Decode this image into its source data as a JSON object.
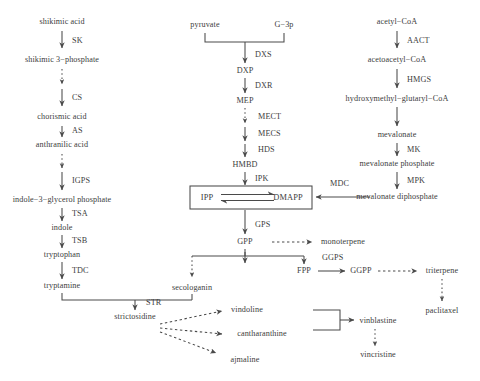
{
  "diagram": {
    "background_color": "#ffffff",
    "text_color": "#3d3d3d",
    "line_color": "#4a4a4a"
  },
  "shikimate_pathway": {
    "name": "shikimate / indole branch",
    "metabolites": [
      {
        "id": "shikimic_acid",
        "label": "shikimic acid",
        "x": 62,
        "y": 22
      },
      {
        "id": "shikimic_3_phosphate",
        "label": "shikimic 3−phosphate",
        "x": 62,
        "y": 60
      },
      {
        "id": "chorismic_acid",
        "label": "chorismic acid",
        "x": 62,
        "y": 117
      },
      {
        "id": "anthranilic_acid",
        "label": "anthranilic acid",
        "x": 62,
        "y": 145
      },
      {
        "id": "indole_3_glycerol_phosphate",
        "label": "indole−3−glycerol phosphate",
        "x": 62,
        "y": 200
      },
      {
        "id": "indole",
        "label": "indole",
        "x": 62,
        "y": 228
      },
      {
        "id": "tryptophan",
        "label": "tryptophan",
        "x": 62,
        "y": 255
      },
      {
        "id": "tryptamine",
        "label": "tryptamine",
        "x": 62,
        "y": 286
      }
    ],
    "enzymes": [
      {
        "id": "SK",
        "label": "SK",
        "x": 72,
        "y": 41,
        "style": "solid"
      },
      {
        "id": "CS",
        "label": "CS",
        "x": 72,
        "y": 98,
        "style": "solid"
      },
      {
        "id": "AS",
        "label": "AS",
        "x": 72,
        "y": 131,
        "style": "solid"
      },
      {
        "id": "IGPS",
        "label": "IGPS",
        "x": 72,
        "y": 181,
        "style": "solid"
      },
      {
        "id": "TSA",
        "label": "TSA",
        "x": 72,
        "y": 214,
        "style": "solid"
      },
      {
        "id": "TSB",
        "label": "TSB",
        "x": 72,
        "y": 241,
        "style": "solid"
      },
      {
        "id": "TDC",
        "label": "TDC",
        "x": 72,
        "y": 271,
        "style": "solid"
      }
    ]
  },
  "mep_pathway": {
    "name": "MEP / non−mevalonate branch",
    "metabolites": [
      {
        "id": "pyruvate",
        "label": "pyruvate",
        "x": 205,
        "y": 25
      },
      {
        "id": "g3p",
        "label": "G−3p",
        "x": 284,
        "y": 25
      },
      {
        "id": "DXP",
        "label": "DXP",
        "x": 245,
        "y": 71
      },
      {
        "id": "MEP",
        "label": "MEP",
        "x": 245,
        "y": 101
      },
      {
        "id": "HMBD",
        "label": "HMBD",
        "x": 245,
        "y": 165
      },
      {
        "id": "GPP",
        "label": "GPP",
        "x": 245,
        "y": 242
      }
    ],
    "enzymes": [
      {
        "id": "DXS",
        "label": "DXS",
        "x": 255,
        "y": 55,
        "style": "solid"
      },
      {
        "id": "DXR",
        "label": "DXR",
        "x": 255,
        "y": 86,
        "style": "solid"
      },
      {
        "id": "MECT",
        "label": "MECT",
        "x": 258,
        "y": 117,
        "style": "dashed"
      },
      {
        "id": "MECS",
        "label": "MECS",
        "x": 258,
        "y": 134,
        "style": "solid"
      },
      {
        "id": "HDS",
        "label": "HDS",
        "x": 258,
        "y": 150,
        "style": "solid"
      },
      {
        "id": "IPK",
        "label": "IPK",
        "x": 255,
        "y": 179,
        "style": "solid"
      },
      {
        "id": "GPS",
        "label": "GPS",
        "x": 255,
        "y": 225,
        "style": "solid"
      }
    ]
  },
  "ipp_box": {
    "left_label": "IPP",
    "right_label": "DMAPP",
    "x": 190,
    "y": 186,
    "width": 122,
    "height": 23,
    "interconversion": "reversible"
  },
  "mevalonate_pathway": {
    "name": "mevalonate branch",
    "metabolites": [
      {
        "id": "acetyl_coa",
        "label": "acetyl−CoA",
        "x": 397,
        "y": 22
      },
      {
        "id": "acetoacetyl_coa",
        "label": "acetoacetyl−CoA",
        "x": 397,
        "y": 60
      },
      {
        "id": "hmg_coa",
        "label": "hydroxymethyl−glutaryl−CoA",
        "x": 397,
        "y": 99
      },
      {
        "id": "mevalonate",
        "label": "mevalonate",
        "x": 397,
        "y": 135
      },
      {
        "id": "mevalonate_phosphate",
        "label": "mevalonate phosphate",
        "x": 397,
        "y": 164
      },
      {
        "id": "mevalonate_diphosphate",
        "label": "mevalonate diphosphate",
        "x": 397,
        "y": 197
      }
    ],
    "enzymes": [
      {
        "id": "AACT",
        "label": "AACT",
        "x": 407,
        "y": 41,
        "style": "solid"
      },
      {
        "id": "HMGS",
        "label": "HMGS",
        "x": 407,
        "y": 80,
        "style": "solid"
      },
      {
        "id": "MK",
        "label": "MK",
        "x": 407,
        "y": 150,
        "style": "solid"
      },
      {
        "id": "MPK",
        "label": "MPK",
        "x": 407,
        "y": 181,
        "style": "solid"
      },
      {
        "id": "MDC",
        "label": "MDC",
        "x": 330,
        "y": 184,
        "style": "solid"
      }
    ]
  },
  "terpenoid_branch": {
    "metabolites": [
      {
        "id": "monoterpene",
        "label": "monoterpene",
        "x": 343,
        "y": 242
      },
      {
        "id": "secologanin",
        "label": "secologanin",
        "x": 192,
        "y": 288
      },
      {
        "id": "FPP",
        "label": "FPP",
        "x": 304,
        "y": 271
      },
      {
        "id": "GGPP",
        "label": "GGPP",
        "x": 360,
        "y": 271
      },
      {
        "id": "triterpene",
        "label": "triterpene",
        "x": 442,
        "y": 271
      },
      {
        "id": "paclitaxel",
        "label": "paclitaxel",
        "x": 442,
        "y": 311
      }
    ],
    "enzymes": [
      {
        "id": "GGPS",
        "label": "GGPS",
        "x": 332,
        "y": 258,
        "style": "solid"
      }
    ]
  },
  "alkaloid_branch": {
    "metabolites": [
      {
        "id": "strictosidine",
        "label": "strictosidine",
        "x": 135,
        "y": 317
      },
      {
        "id": "vindoline",
        "label": "vindoline",
        "x": 247,
        "y": 310
      },
      {
        "id": "catharanthine",
        "label": "cantharanthine",
        "x": 260,
        "y": 334
      },
      {
        "id": "ajmaline",
        "label": "ajmaline",
        "x": 245,
        "y": 360
      },
      {
        "id": "vinblastine",
        "label": "vinblastine",
        "x": 375,
        "y": 321
      },
      {
        "id": "vincristine",
        "label": "vincristine",
        "x": 375,
        "y": 355
      }
    ],
    "enzymes": [
      {
        "id": "STR",
        "label": "STR",
        "x": 146,
        "y": 303,
        "style": "solid"
      }
    ]
  },
  "edge_styles": {
    "solid": "single enzymatic step",
    "dashed": "multiple / omitted steps"
  }
}
